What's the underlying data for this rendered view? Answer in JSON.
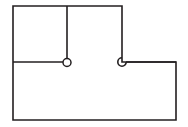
{
  "canvas": {
    "width": 188,
    "height": 127,
    "background_color": "#ffffff"
  },
  "drawing": {
    "title": "floor-plan-outline",
    "description": "L-shaped polygon outline with interior vertical partition and two door/pivot symbols",
    "stroke_color": "#231f20",
    "stroke_width": 1.6,
    "fill_color": "none",
    "line_join": "miter",
    "line_cap": "butt"
  },
  "geometry": {
    "outer_outline_points": "13,6 122,6 122,62 176,62 176,120 13,120 13,62 13,6",
    "outer_outline_path": "M 13 6 L 122 6 L 122 62 L 176 62 L 176 120 L 13 120 Z",
    "interior_wall_horizontal": {
      "x1": 13,
      "y1": 62,
      "x2": 63,
      "y2": 62
    },
    "interior_wall_vertical": {
      "x1": 67,
      "y1": 6,
      "x2": 67,
      "y2": 59
    },
    "right_wall_vertical": {
      "x1": 122,
      "y1": 6,
      "x2": 122,
      "y2": 58
    },
    "right_sill_horizontal": {
      "x1": 126,
      "y1": 62,
      "x2": 176,
      "y2": 62
    }
  },
  "symbols": [
    {
      "name": "left-pivot-circle",
      "kind": "circle",
      "cx": 67,
      "cy": 62.5,
      "r": 4.0,
      "label": "closed pivot node"
    },
    {
      "name": "right-hook-arc",
      "kind": "arc",
      "cx": 122,
      "cy": 62,
      "r": 4.2,
      "path": "M 122 57.8 A 4.2 4.2 0 1 0 126.2 62",
      "label": "open hook / notch node"
    }
  ],
  "labels": {
    "caption": ""
  },
  "colors": {
    "stroke": "#231f20",
    "background": "#ffffff"
  }
}
